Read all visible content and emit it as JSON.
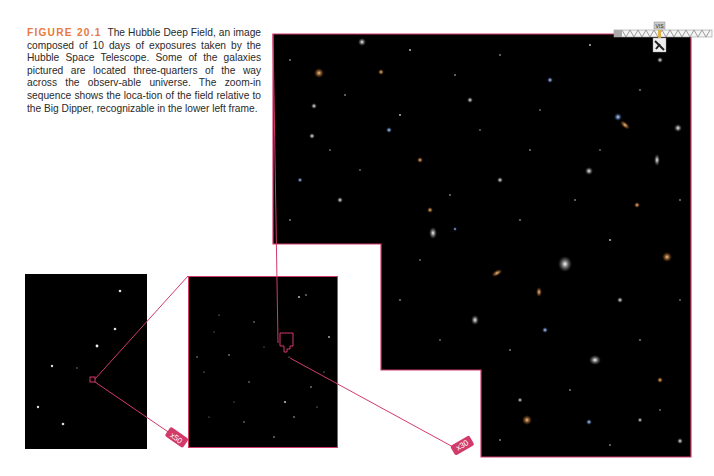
{
  "caption": {
    "label": "FIGURE 20.1",
    "text": "The Hubble Deep Field, an image composed of 10 days of exposures taken by the Hubble Space Telescope. Some of the galaxies pictured are located three-quarters of the way across the observ-able universe. The zoom-in sequence shows the loca-tion of the field relative to the Big Dipper, recognizable in the lower left frame."
  },
  "frames": {
    "big_dipper": {
      "description": "Big Dipper star field"
    },
    "mid_field": {
      "description": "Zoomed star field"
    },
    "deep_field": {
      "description": "Hubble Deep Field galaxies"
    }
  },
  "zoom_labels": {
    "first": "x50",
    "second": "x30"
  },
  "telescope_icon": {
    "label": "VIS"
  },
  "colors": {
    "accent": "#d23a6a",
    "label_orange": "#e87a3f",
    "frame_bg": "#000000"
  }
}
